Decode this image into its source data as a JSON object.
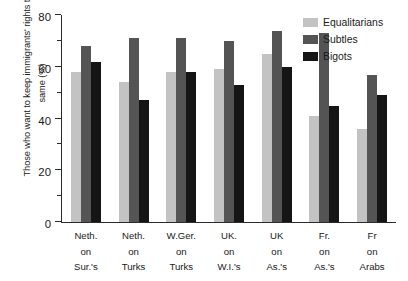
{
  "chart_data": {
    "type": "bar",
    "title": "",
    "xlabel": "",
    "ylabel": "Those who want to keep immigrants' rights the same (%)",
    "ylim": [
      0,
      80
    ],
    "yticks": [
      0,
      20,
      40,
      60,
      80
    ],
    "ytick_labels": [
      "0",
      "20",
      "40",
      "60",
      "80"
    ],
    "yminor_ticks": [
      10,
      30,
      50,
      70
    ],
    "grid": false,
    "legend_position": "top-right",
    "categories": [
      "Neth. on Sur.'s",
      "Neth. on Turks",
      "W.Ger. on Turks",
      "UK. on W.I.'s",
      "UK on As.'s",
      "Fr. on As.'s",
      "Fr on Arabs"
    ],
    "category_lines": [
      [
        "Neth.",
        "on",
        "Sur.'s"
      ],
      [
        "Neth.",
        "on",
        "Turks"
      ],
      [
        "W.Ger.",
        "on",
        "Turks"
      ],
      [
        "UK.",
        "on",
        "W.I.'s"
      ],
      [
        "UK",
        "on",
        "As.'s"
      ],
      [
        "Fr.",
        "on",
        "As.'s"
      ],
      [
        "Fr",
        "on",
        "Arabs"
      ]
    ],
    "series": [
      {
        "name": "Equalitarians",
        "color": "#c3c3c3",
        "values": [
          58,
          54,
          58,
          59,
          65,
          41,
          36
        ]
      },
      {
        "name": "Subtles",
        "color": "#545454",
        "values": [
          68,
          71,
          71,
          70,
          74,
          73,
          57
        ]
      },
      {
        "name": "Bigots",
        "color": "#151515",
        "values": [
          62,
          47,
          58,
          53,
          60,
          45,
          49
        ]
      }
    ]
  },
  "legend": {
    "entries": [
      {
        "label": "Equalitarians",
        "color": "#c3c3c3"
      },
      {
        "label": "Subtles",
        "color": "#545454"
      },
      {
        "label": "Bigots",
        "color": "#151515"
      }
    ]
  }
}
